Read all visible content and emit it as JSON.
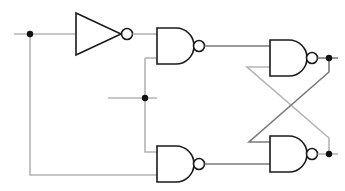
{
  "diagram": {
    "type": "logic-circuit",
    "colors": {
      "background": "#ffffff",
      "gate_stroke": "#1a1a1a",
      "wire_light": "#b4b4b4",
      "wire_dark": "#7a7a7a",
      "node": "#111111"
    },
    "components": [
      {
        "id": "not1",
        "kind": "NOT"
      },
      {
        "id": "nand1",
        "kind": "NAND",
        "position": "top-left"
      },
      {
        "id": "nand2",
        "kind": "NAND",
        "position": "bottom-left"
      },
      {
        "id": "nand3",
        "kind": "NAND",
        "position": "top-right"
      },
      {
        "id": "nand4",
        "kind": "NAND",
        "position": "bottom-right"
      }
    ],
    "junction_nodes": 4,
    "labels": []
  }
}
